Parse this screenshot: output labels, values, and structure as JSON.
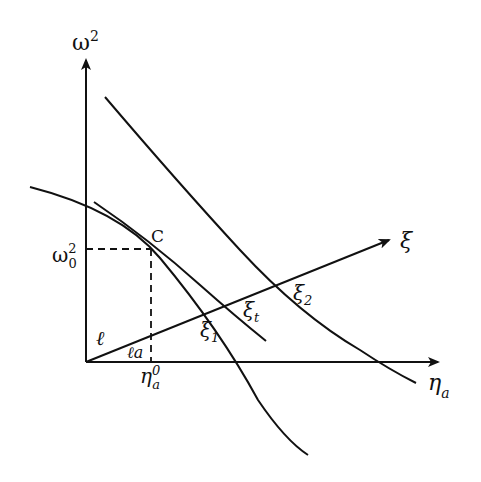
{
  "diagram": {
    "axes": {
      "y_label": "ω",
      "y_label_sup": "2",
      "x_label": "η",
      "x_label_sub": "a"
    },
    "ray": {
      "label": "ξ"
    },
    "point": {
      "label": "C"
    },
    "y_marker": {
      "base": "ω",
      "sub": "0",
      "sup": "2"
    },
    "x_marker": {
      "base": "η",
      "sub": "a",
      "sup": "0"
    },
    "angle_labels": {
      "l": "ℓ",
      "la": "ℓa"
    },
    "intersections": {
      "xi1": {
        "base": "ξ",
        "sub": "1"
      },
      "xit": {
        "base": "ξ",
        "sub": "t"
      },
      "xi2": {
        "base": "ξ",
        "sub": "2"
      }
    },
    "colors": {
      "ink": "#111111",
      "background": "#ffffff"
    }
  }
}
